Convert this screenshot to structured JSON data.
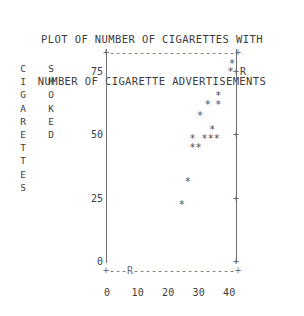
{
  "title": {
    "line1": "PLOT OF NUMBER OF CIGARETTES WITH",
    "line2": "NUMBER OF CIGARETTE ADVERTISEMENTS"
  },
  "axis_word_labels": {
    "left_outer": "CIGARETTES",
    "left_inner": "SMOKED"
  },
  "marks": {
    "point_glyph": "*",
    "corner_glyph": "+",
    "tick_glyph": "+",
    "r_label": "R",
    "dash_top": "+-------------+",
    "dash_bottom": "+---R---------+"
  },
  "colors": {
    "background": "#ffffff",
    "text": "#3c3c3c",
    "axis": "#6e6e6e",
    "point": "#4a4a4a"
  },
  "chart_data": {
    "type": "scatter",
    "title": "PLOT OF NUMBER OF CIGARETTES WITH NUMBER OF CIGARETTE ADVERTISEMENTS",
    "xlabel": "",
    "ylabel": "CIGARETTES SMOKED",
    "xlim": [
      0,
      45
    ],
    "ylim": [
      0,
      80
    ],
    "xticks": [
      0,
      10,
      20,
      30,
      40
    ],
    "xtick_labels": [
      "0",
      "10",
      "20",
      "30",
      "40"
    ],
    "yticks": [
      0,
      25,
      50,
      75
    ],
    "ytick_labels": [
      "0",
      "25",
      "50",
      "75"
    ],
    "right_axis_ticks": [
      0,
      25,
      50,
      75
    ],
    "grid": false,
    "legend": null,
    "marker": "*",
    "annotations": [
      {
        "text": "R",
        "x": 42.5,
        "y": 75.0,
        "note": "right-axis row label"
      },
      {
        "text": "R",
        "x": 7.0,
        "y": -3.0,
        "note": "bottom dashed-rule label"
      }
    ],
    "points": [
      {
        "x": 41.0,
        "y": 78.0
      },
      {
        "x": 40.5,
        "y": 75.0
      },
      {
        "x": 36.5,
        "y": 65.5
      },
      {
        "x": 33.0,
        "y": 62.0
      },
      {
        "x": 36.5,
        "y": 62.0
      },
      {
        "x": 30.5,
        "y": 57.5
      },
      {
        "x": 34.5,
        "y": 52.0
      },
      {
        "x": 28.0,
        "y": 48.5
      },
      {
        "x": 32.0,
        "y": 48.5
      },
      {
        "x": 34.0,
        "y": 48.5
      },
      {
        "x": 36.0,
        "y": 48.5
      },
      {
        "x": 28.0,
        "y": 45.0
      },
      {
        "x": 30.0,
        "y": 45.0
      },
      {
        "x": 26.5,
        "y": 31.5
      },
      {
        "x": 24.5,
        "y": 22.5
      }
    ]
  }
}
